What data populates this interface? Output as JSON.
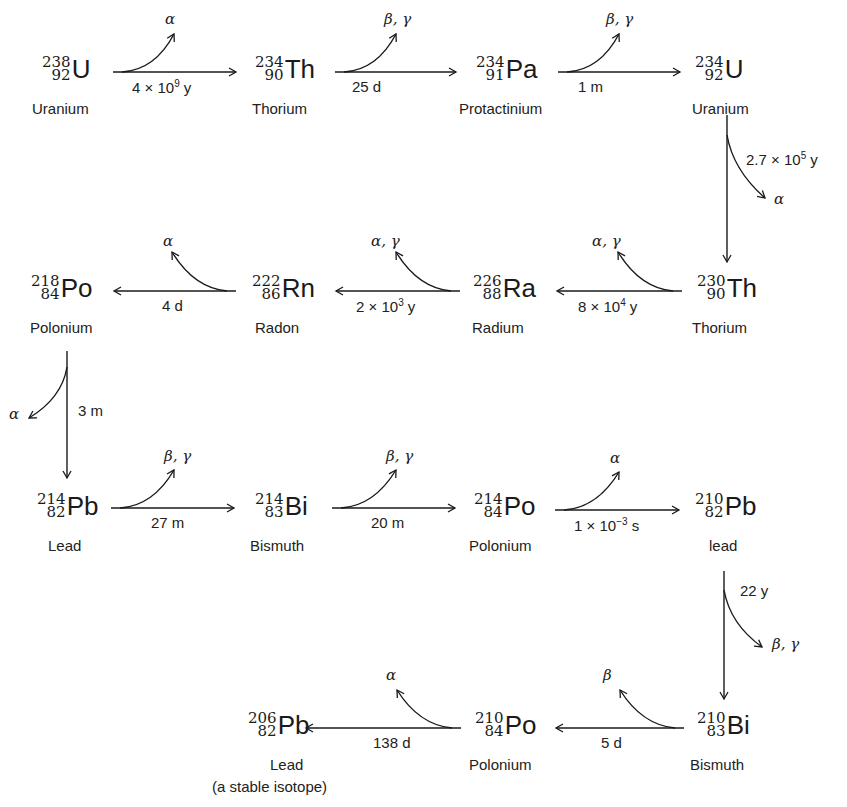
{
  "nuclides": [
    {
      "id": "u238",
      "mass": "238",
      "z": "92",
      "symbol": "U",
      "name": "Uranium",
      "x": 42,
      "y": 56,
      "nx": 32,
      "ny": 100
    },
    {
      "id": "th234",
      "mass": "234",
      "z": "90",
      "symbol": "Th",
      "name": "Thorium",
      "x": 255,
      "y": 56,
      "nx": 252,
      "ny": 100
    },
    {
      "id": "pa234",
      "mass": "234",
      "z": "91",
      "symbol": "Pa",
      "name": "Protactinium",
      "x": 476,
      "y": 56,
      "nx": 459,
      "ny": 100
    },
    {
      "id": "u234",
      "mass": "234",
      "z": "92",
      "symbol": "U",
      "name": "Uranium",
      "x": 695,
      "y": 56,
      "nx": 692,
      "ny": 100
    },
    {
      "id": "th230",
      "mass": "230",
      "z": "90",
      "symbol": "Th",
      "name": "Thorium",
      "x": 697,
      "y": 275,
      "nx": 692,
      "ny": 319
    },
    {
      "id": "ra226",
      "mass": "226",
      "z": "88",
      "symbol": "Ra",
      "name": "Radium",
      "x": 473,
      "y": 275,
      "nx": 472,
      "ny": 319
    },
    {
      "id": "rn222",
      "mass": "222",
      "z": "86",
      "symbol": "Rn",
      "name": "Radon",
      "x": 252,
      "y": 275,
      "nx": 255,
      "ny": 319
    },
    {
      "id": "po218",
      "mass": "218",
      "z": "84",
      "symbol": "Po",
      "name": "Polonium",
      "x": 31,
      "y": 275,
      "nx": 30,
      "ny": 319
    },
    {
      "id": "pb214",
      "mass": "214",
      "z": "82",
      "symbol": "Pb",
      "name": "Lead",
      "x": 37,
      "y": 493,
      "nx": 48,
      "ny": 537
    },
    {
      "id": "bi214",
      "mass": "214",
      "z": "83",
      "symbol": "Bi",
      "name": "Bismuth",
      "x": 255,
      "y": 493,
      "nx": 250,
      "ny": 537
    },
    {
      "id": "po214",
      "mass": "214",
      "z": "84",
      "symbol": "Po",
      "name": "Polonium",
      "x": 474,
      "y": 493,
      "nx": 469,
      "ny": 537
    },
    {
      "id": "pb210",
      "mass": "210",
      "z": "82",
      "symbol": "Pb",
      "name": "lead",
      "x": 695,
      "y": 493,
      "nx": 709,
      "ny": 537
    },
    {
      "id": "bi210",
      "mass": "210",
      "z": "83",
      "symbol": "Bi",
      "name": "Bismuth",
      "x": 697,
      "y": 712,
      "nx": 690,
      "ny": 756
    },
    {
      "id": "po210",
      "mass": "210",
      "z": "84",
      "symbol": "Po",
      "name": "Polonium",
      "x": 475,
      "y": 712,
      "nx": 469,
      "ny": 756
    },
    {
      "id": "pb206",
      "mass": "206",
      "z": "82",
      "symbol": "Pb",
      "name": "Lead",
      "note": "(a stable isotope)",
      "x": 248,
      "y": 712,
      "nx": 270,
      "ny": 756,
      "notex": 212,
      "notey": 778
    }
  ],
  "decays": [
    {
      "from": "u238",
      "to": "th234",
      "half_life": "4 × 10",
      "exp": "9",
      "unit": " y",
      "emission": "α"
    },
    {
      "from": "th234",
      "to": "pa234",
      "half_life": "25 d",
      "emission": "β, γ"
    },
    {
      "from": "pa234",
      "to": "u234",
      "half_life": "1 m",
      "emission": "β, γ"
    },
    {
      "from": "u234",
      "to": "th230",
      "half_life": "2.7 × 10",
      "exp": "5",
      "unit": " y",
      "emission": "α"
    },
    {
      "from": "th230",
      "to": "ra226",
      "half_life": "8 × 10",
      "exp": "4",
      "unit": " y",
      "emission": "α, γ"
    },
    {
      "from": "ra226",
      "to": "rn222",
      "half_life": "2 × 10",
      "exp": "3",
      "unit": " y",
      "emission": "α, γ"
    },
    {
      "from": "rn222",
      "to": "po218",
      "half_life": "4 d",
      "emission": "α"
    },
    {
      "from": "po218",
      "to": "pb214",
      "half_life": "3 m",
      "emission": "α"
    },
    {
      "from": "pb214",
      "to": "bi214",
      "half_life": "27 m",
      "emission": "β, γ"
    },
    {
      "from": "bi214",
      "to": "po214",
      "half_life": "20 m",
      "emission": "β, γ"
    },
    {
      "from": "po214",
      "to": "pb210",
      "half_life": "1 × 10",
      "exp": "−3",
      "unit": " s",
      "emission": "α"
    },
    {
      "from": "pb210",
      "to": "bi210",
      "half_life": "22 y",
      "emission": "β, γ"
    },
    {
      "from": "bi210",
      "to": "po210",
      "half_life": "5 d",
      "emission": "β"
    },
    {
      "from": "po210",
      "to": "pb206",
      "half_life": "138 d",
      "emission": "α"
    }
  ],
  "colors": {
    "ink": "#1a1a1a",
    "background": "#ffffff"
  }
}
